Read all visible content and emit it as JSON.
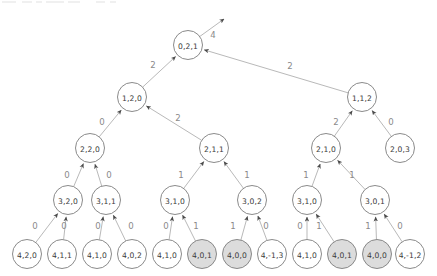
{
  "figure": {
    "type": "directed-graph-tree",
    "background": "#ffffff",
    "node_fill_plain": "#ffffff",
    "node_fill_shaded": "#dcdcdc",
    "node_stroke": "#7d7d7d",
    "edge_color": "#b9b9b9",
    "arrow_color": "#4a4a4a",
    "node_label_color": "#3a3a3a",
    "edge_label_color": "#8a8a8a",
    "node_radius": 14.5,
    "leaf_radius": 14.5
  },
  "nodes": [
    {
      "id": "n0",
      "label": "0,2,1",
      "x": 188,
      "y": 45,
      "r": 14.5,
      "shaded": false,
      "level": 0
    },
    {
      "id": "n1",
      "label": "1,2,0",
      "x": 132,
      "y": 97,
      "r": 14.5,
      "shaded": false,
      "level": 1
    },
    {
      "id": "n2",
      "label": "1,1,2",
      "x": 362,
      "y": 97,
      "r": 14.5,
      "shaded": false,
      "level": 1
    },
    {
      "id": "n3",
      "label": "2,2,0",
      "x": 90,
      "y": 148,
      "r": 14.5,
      "shaded": false,
      "level": 2
    },
    {
      "id": "n4",
      "label": "2,1,1",
      "x": 214,
      "y": 148,
      "r": 14.5,
      "shaded": false,
      "level": 2
    },
    {
      "id": "n5",
      "label": "2,1,0",
      "x": 326,
      "y": 148,
      "r": 14.5,
      "shaded": false,
      "level": 2
    },
    {
      "id": "n6",
      "label": "2,0,3",
      "x": 400,
      "y": 148,
      "r": 14.5,
      "shaded": false,
      "level": 2
    },
    {
      "id": "n7",
      "label": "3,2,0",
      "x": 68,
      "y": 200,
      "r": 14.5,
      "shaded": false,
      "level": 3
    },
    {
      "id": "n8",
      "label": "3,1,1",
      "x": 106,
      "y": 200,
      "r": 14.5,
      "shaded": false,
      "level": 3
    },
    {
      "id": "n9",
      "label": "3,1,0",
      "x": 175,
      "y": 200,
      "r": 14.5,
      "shaded": false,
      "level": 3
    },
    {
      "id": "n10",
      "label": "3,0,2",
      "x": 252,
      "y": 200,
      "r": 14.5,
      "shaded": false,
      "level": 3
    },
    {
      "id": "n11",
      "label": "3,1,0",
      "x": 307,
      "y": 200,
      "r": 14.5,
      "shaded": false,
      "level": 3
    },
    {
      "id": "n12",
      "label": "3,0,1",
      "x": 375,
      "y": 200,
      "r": 14.5,
      "shaded": false,
      "level": 3
    },
    {
      "id": "n13",
      "label": "4,2,0",
      "x": 27,
      "y": 254,
      "r": 14.5,
      "shaded": false,
      "level": 4
    },
    {
      "id": "n14",
      "label": "4,1,1",
      "x": 62,
      "y": 254,
      "r": 14.5,
      "shaded": false,
      "level": 4
    },
    {
      "id": "n15",
      "label": "4,1,0",
      "x": 97,
      "y": 254,
      "r": 14.5,
      "shaded": false,
      "level": 4
    },
    {
      "id": "n16",
      "label": "4,0,2",
      "x": 132,
      "y": 254,
      "r": 14.5,
      "shaded": false,
      "level": 4
    },
    {
      "id": "n17",
      "label": "4,1,0",
      "x": 167,
      "y": 254,
      "r": 14.5,
      "shaded": false,
      "level": 4
    },
    {
      "id": "n18",
      "label": "4,0,1",
      "x": 202,
      "y": 254,
      "r": 14.5,
      "shaded": true,
      "level": 4
    },
    {
      "id": "n19",
      "label": "4,0,0",
      "x": 237,
      "y": 254,
      "r": 14.5,
      "shaded": true,
      "level": 4
    },
    {
      "id": "n20",
      "label": "4,-1,3",
      "x": 272,
      "y": 254,
      "r": 14.5,
      "shaded": false,
      "level": 4
    },
    {
      "id": "n21",
      "label": "4,1,0",
      "x": 307,
      "y": 254,
      "r": 14.5,
      "shaded": false,
      "level": 4
    },
    {
      "id": "n22",
      "label": "4,0,1",
      "x": 342,
      "y": 254,
      "r": 14.5,
      "shaded": true,
      "level": 4
    },
    {
      "id": "n23",
      "label": "4,0,0",
      "x": 377,
      "y": 254,
      "r": 14.5,
      "shaded": true,
      "level": 4
    },
    {
      "id": "n24",
      "label": "4,-1,2",
      "x": 410,
      "y": 254,
      "r": 14.5,
      "shaded": false,
      "level": 4
    }
  ],
  "edges": [
    {
      "from": "n0",
      "to": "out",
      "label": "4",
      "label_x": 213,
      "label_y": 35,
      "tip_x": 224,
      "tip_y": 19,
      "open_end": true
    },
    {
      "from": "n1",
      "to": "n0",
      "label": "2",
      "label_x": 153,
      "label_y": 65
    },
    {
      "from": "n2",
      "to": "n0",
      "label": "2",
      "label_x": 290,
      "label_y": 66
    },
    {
      "from": "n3",
      "to": "n1",
      "label": "0",
      "label_x": 102,
      "label_y": 122
    },
    {
      "from": "n4",
      "to": "n1",
      "label": "2",
      "label_x": 178,
      "label_y": 118
    },
    {
      "from": "n5",
      "to": "n2",
      "label": "2",
      "label_x": 336,
      "label_y": 122
    },
    {
      "from": "n6",
      "to": "n2",
      "label": "0",
      "label_x": 391,
      "label_y": 122
    },
    {
      "from": "n7",
      "to": "n3",
      "label": "0",
      "label_x": 67,
      "label_y": 175
    },
    {
      "from": "n8",
      "to": "n3",
      "label": "0",
      "label_x": 109,
      "label_y": 175
    },
    {
      "from": "n9",
      "to": "n4",
      "label": "1",
      "label_x": 181,
      "label_y": 175
    },
    {
      "from": "n10",
      "to": "n4",
      "label": "1",
      "label_x": 247,
      "label_y": 175
    },
    {
      "from": "n11",
      "to": "n5",
      "label": "1",
      "label_x": 306,
      "label_y": 175
    },
    {
      "from": "n12",
      "to": "n5",
      "label": "1",
      "label_x": 352,
      "label_y": 175
    },
    {
      "from": "n13",
      "to": "n7",
      "label": "0",
      "label_x": 35,
      "label_y": 226
    },
    {
      "from": "n14",
      "to": "n7",
      "label": "0",
      "label_x": 64,
      "label_y": 226
    },
    {
      "from": "n15",
      "to": "n8",
      "label": "0",
      "label_x": 98,
      "label_y": 226
    },
    {
      "from": "n16",
      "to": "n8",
      "label": "0",
      "label_x": 131,
      "label_y": 226
    },
    {
      "from": "n17",
      "to": "n9",
      "label": "0",
      "label_x": 166,
      "label_y": 226
    },
    {
      "from": "n18",
      "to": "n9",
      "label": "1",
      "label_x": 196,
      "label_y": 226
    },
    {
      "from": "n19",
      "to": "n10",
      "label": "1",
      "label_x": 233,
      "label_y": 226
    },
    {
      "from": "n20",
      "to": "n10",
      "label": "0",
      "label_x": 266,
      "label_y": 226
    },
    {
      "from": "n21",
      "to": "n11",
      "label": "0",
      "label_x": 300,
      "label_y": 226
    },
    {
      "from": "n22",
      "to": "n11",
      "label": "1",
      "label_x": 319,
      "label_y": 226
    },
    {
      "from": "n23",
      "to": "n12",
      "label": "1",
      "label_x": 368,
      "label_y": 226
    },
    {
      "from": "n24",
      "to": "n12",
      "label": "0",
      "label_x": 400,
      "label_y": 226
    }
  ],
  "top_artifact": {
    "visible": true,
    "segments": [
      {
        "x": 2,
        "w": 14
      },
      {
        "x": 22,
        "w": 10
      },
      {
        "x": 36,
        "w": 6
      },
      {
        "x": 46,
        "w": 18
      },
      {
        "x": 68,
        "w": 12
      },
      {
        "x": 96,
        "w": 9
      },
      {
        "x": 110,
        "w": 6
      }
    ]
  }
}
